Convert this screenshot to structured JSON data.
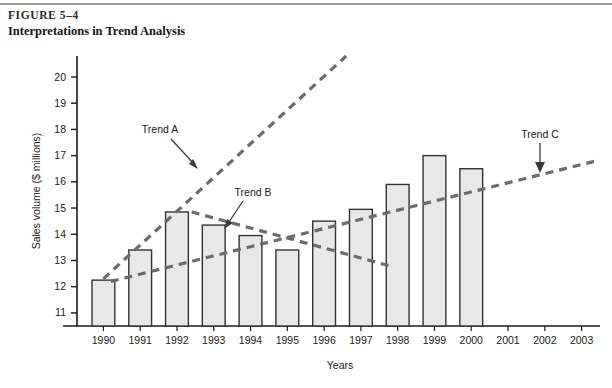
{
  "figure": {
    "number": "FIGURE 5–4",
    "title": "Interpretations in Trend Analysis"
  },
  "chart_data": {
    "type": "bar",
    "title": "Interpretations in Trend Analysis",
    "xlabel": "Years",
    "ylabel": "Sales volume ($ millions)",
    "categories": [
      "1990",
      "1991",
      "1992",
      "1993",
      "1994",
      "1995",
      "1996",
      "1997",
      "1998",
      "1999",
      "2000",
      "2001",
      "2002",
      "2003"
    ],
    "values": [
      12.25,
      13.4,
      14.85,
      14.35,
      13.95,
      13.4,
      14.5,
      14.95,
      15.9,
      17.0,
      16.5,
      null,
      null,
      null
    ],
    "ylim": [
      10.5,
      20.8
    ],
    "yticks": [
      11,
      12,
      13,
      14,
      15,
      16,
      17,
      18,
      19,
      20
    ],
    "ytick_labels": [
      "11",
      "12",
      "13",
      "14",
      "15",
      "16",
      "17",
      "18",
      "19",
      "20"
    ],
    "grid": false,
    "legend": "none",
    "bar_fill": "#e8e8e8",
    "bar_stroke": "#333333",
    "annotations": [
      {
        "name": "Trend A",
        "label": "Trend A",
        "type": "trendline",
        "style": "dashed",
        "color": "#6b6b6b",
        "from": {
          "x": 1990.0,
          "y": 12.3
        },
        "to": {
          "x": 1996.6,
          "y": 20.8
        },
        "description": "Rising long-run trend from 1990 through projection"
      },
      {
        "name": "Trend B",
        "label": "Trend B",
        "type": "trendline",
        "style": "dashed",
        "color": "#6b6b6b",
        "from": {
          "x": 1992.4,
          "y": 14.85
        },
        "to": {
          "x": 1997.9,
          "y": 12.75
        },
        "description": "Declining short-run trend from the 1992 peak"
      },
      {
        "name": "Trend C",
        "label": "Trend C",
        "type": "trendline",
        "style": "dashed",
        "color": "#6b6b6b",
        "from": {
          "x": 1990.2,
          "y": 12.2
        },
        "to": {
          "x": 2003.4,
          "y": 16.8
        },
        "description": "Shallow rising trend extended through 2003"
      }
    ]
  },
  "axes": {
    "y_title": "Sales volume ($ millions)",
    "x_title": "Years"
  },
  "labels": {
    "trend_a": "Trend A",
    "trend_b": "Trend B",
    "trend_c": "Trend C"
  }
}
